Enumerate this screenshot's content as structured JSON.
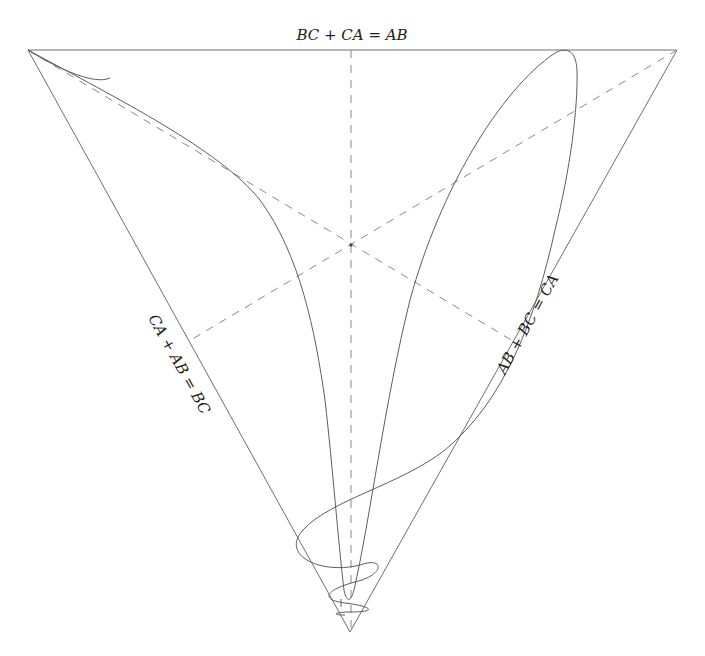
{
  "diagram": {
    "type": "triangle-orbit-plot",
    "edge_labels": {
      "top": "BC + CA = AB",
      "left": "CA + AB = BC",
      "right": "AB + BC = CA"
    },
    "vertices": {
      "top_left": [
        28,
        50
      ],
      "top_right": [
        677,
        50
      ],
      "bottom": [
        350,
        632
      ]
    },
    "centroid": [
      351,
      245
    ],
    "colors": {
      "edge": "#6e6e6e",
      "median": "#8a8a8a",
      "curve": "#5e5e5e",
      "text": "#222222"
    }
  }
}
